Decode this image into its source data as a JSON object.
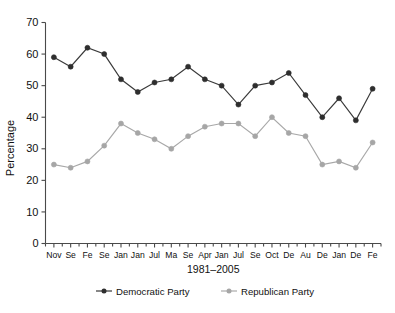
{
  "chart_data": {
    "type": "line",
    "title": "",
    "xlabel": "1981–2005",
    "ylabel": "Percentage",
    "ylim": [
      0,
      70
    ],
    "ytick_step": 10,
    "yticks": [
      0,
      10,
      20,
      30,
      40,
      50,
      60,
      70
    ],
    "grid": false,
    "legend_position": "bottom",
    "categories": [
      "Nov",
      "Se",
      "Fe",
      "Se",
      "Jan",
      "Jan",
      "Jul",
      "Ma",
      "Se",
      "Apr",
      "Jan",
      "Jul",
      "Se",
      "Oct",
      "De",
      "Au",
      "De",
      "Jan",
      "De",
      "Fe"
    ],
    "x": [
      "Nov",
      "Se",
      "Fe",
      "Se",
      "Jan",
      "Jan",
      "Jul",
      "Ma",
      "Se",
      "Apr",
      "Jan",
      "Jul",
      "Se",
      "Oct",
      "De",
      "Au",
      "De",
      "Jan",
      "De",
      "Fe"
    ],
    "series": [
      {
        "name": "Democratic Party",
        "color": "#2e2e2e",
        "marker": "filled-circle",
        "values": [
          59,
          56,
          62,
          60,
          52,
          48,
          51,
          52,
          56,
          52,
          50,
          44,
          50,
          51,
          54,
          47,
          40,
          46,
          39,
          49
        ]
      },
      {
        "name": "Republican Party",
        "color": "#a6a6a6",
        "marker": "filled-circle",
        "values": [
          25,
          24,
          26,
          31,
          38,
          35,
          33,
          30,
          34,
          37,
          38,
          38,
          34,
          40,
          35,
          34,
          25,
          26,
          24,
          32
        ]
      }
    ],
    "annotations": []
  },
  "legend": {
    "items": [
      {
        "label": "Democratic Party",
        "color": "#2e2e2e"
      },
      {
        "label": "Republican Party",
        "color": "#a6a6a6"
      }
    ]
  },
  "axes": {
    "y_title": "Percentage",
    "x_title": "1981–2005"
  }
}
